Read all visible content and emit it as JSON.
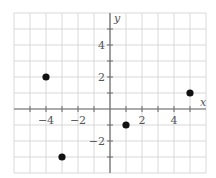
{
  "chart_data": {
    "type": "scatter",
    "title": "",
    "xlabel": "x",
    "ylabel": "y",
    "xlim": [
      -6,
      6
    ],
    "ylim": [
      -4,
      6
    ],
    "grid": true,
    "grid_step": 1,
    "x_ticks": [
      -4,
      -2,
      2,
      4
    ],
    "x_tick_labels": [
      "−4",
      "−2",
      "2",
      "4"
    ],
    "y_ticks": [
      -2,
      2,
      4
    ],
    "y_tick_labels": [
      "−2",
      "2",
      "4"
    ],
    "points": [
      {
        "x": -4,
        "y": 2
      },
      {
        "x": -3,
        "y": -3
      },
      {
        "x": 1,
        "y": -1
      },
      {
        "x": 5,
        "y": 1
      }
    ],
    "point_color": "#111111"
  }
}
